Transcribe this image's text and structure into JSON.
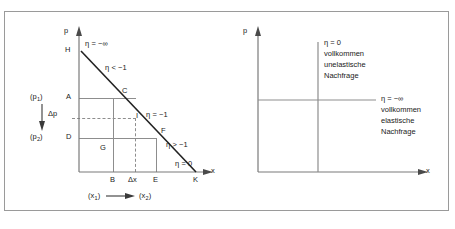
{
  "figure": {
    "border_color": "#9a9a9a",
    "line_color": "#8d8d8d",
    "curve_color": "#222222",
    "text_color": "#1a1a1a"
  },
  "left_diagram": {
    "axis_y_label": "p",
    "axis_x_label": "x",
    "points": {
      "H": "H",
      "A": "A",
      "C": "C",
      "I": "I",
      "D": "D",
      "F": "F",
      "G": "G",
      "B": "B",
      "E": "E",
      "K": "K"
    },
    "elasticity_labels": [
      {
        "id": "eta-minus-infinity",
        "text": "η = −∞"
      },
      {
        "id": "eta-less-than-minus-one",
        "text": "η < −1"
      },
      {
        "id": "eta-equals-minus-one",
        "text": "η = −1"
      },
      {
        "id": "eta-greater-than-minus-one",
        "text": "η > −1"
      },
      {
        "id": "eta-equals-zero",
        "text": "η = 0"
      }
    ],
    "price_labels": {
      "p1": "(p",
      "p1_sub": "1",
      "p1_end": ")",
      "p2": "(p",
      "p2_sub": "2",
      "p2_end": ")",
      "delta_p": "Δp"
    },
    "quantity_labels": {
      "delta_x": "Δx",
      "x1": "(x",
      "x1_sub": "1",
      "x1_end": ")",
      "x2": "(x",
      "x2_sub": "2",
      "x2_end": ")"
    }
  },
  "right_diagram": {
    "axis_y_label": "p",
    "axis_x_label": "x",
    "inelastic": {
      "eta": "η = 0",
      "line1": "vollkommen",
      "line2": "unelastische",
      "line3": "Nachfrage"
    },
    "elastic": {
      "eta": "η = −∞",
      "line1": "vollkommen",
      "line2": "elastische",
      "line3": "Nachfrage"
    }
  }
}
